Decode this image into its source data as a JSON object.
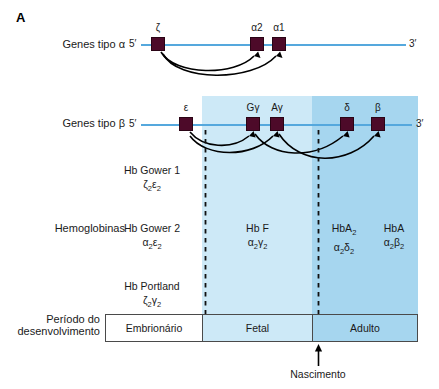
{
  "panel": {
    "letter": "A"
  },
  "rows": {
    "alpha": {
      "label": "Genes tipo α",
      "five_prime": "5′",
      "three_prime": "3′",
      "genes": [
        {
          "name": "zeta",
          "tag": "ζ",
          "x": 158
        },
        {
          "name": "alpha2",
          "tag": "α2",
          "x": 257
        },
        {
          "name": "alpha1",
          "tag": "α1",
          "x": 279
        }
      ]
    },
    "beta": {
      "label": "Genes tipo β",
      "five_prime": "5′",
      "three_prime": "3′",
      "genes": [
        {
          "name": "epsilon",
          "tag": "ε",
          "x": 186
        },
        {
          "name": "g-gamma",
          "tag": "Gγ",
          "x": 253
        },
        {
          "name": "a-gamma",
          "tag": "Aγ",
          "x": 277
        },
        {
          "name": "delta",
          "tag": "δ",
          "x": 347
        },
        {
          "name": "beta",
          "tag": "β",
          "x": 378
        }
      ]
    }
  },
  "hemoglobins": {
    "label": "Hemoglobinas",
    "entries": [
      {
        "name": "hb-gower-1",
        "title": "Hb Gower 1",
        "formula_html": "ζ<sub>2</sub>ε<sub>2</sub>",
        "x": 152,
        "y": 163
      },
      {
        "name": "hb-gower-2",
        "title": "Hb Gower 2",
        "formula_html": "α<sub>2</sub>ε<sub>2</sub>",
        "x": 152,
        "y": 221
      },
      {
        "name": "hb-portland",
        "title": "Hb Portland",
        "formula_html": "ζ<sub>2</sub>γ<sub>2</sub>",
        "x": 152,
        "y": 279
      },
      {
        "name": "hb-f",
        "title": "Hb F",
        "formula_html": "α<sub>2</sub>γ<sub>2</sub>",
        "x": 257,
        "y": 221
      },
      {
        "name": "hb-a2",
        "title": "HbA<sub>2</sub>",
        "formula_html": "α<sub>2</sub>δ<sub>2</sub>",
        "x": 344,
        "y": 221
      },
      {
        "name": "hb-a",
        "title": "HbA",
        "formula_html": "α<sub>2</sub>β<sub>2</sub>",
        "x": 394,
        "y": 221
      }
    ]
  },
  "period": {
    "label_line1": "Período do",
    "label_line2": "desenvolvimento",
    "cells": [
      {
        "name": "embrionario",
        "label": "Embrionário"
      },
      {
        "name": "fetal",
        "label": "Fetal"
      },
      {
        "name": "adulto",
        "label": "Adulto"
      }
    ]
  },
  "birth": {
    "label": "Nascimento"
  },
  "colors": {
    "gene_box": "#4d0a29",
    "gene_line": "#55a8dd",
    "band_fetal": "#cde9f7",
    "band_adult": "#a6d6ef",
    "arc": "#000000",
    "text": "#1a1a1a"
  }
}
